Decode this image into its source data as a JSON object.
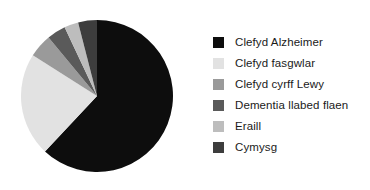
{
  "chart_data": {
    "type": "pie",
    "title": "",
    "labels": [
      "Clefyd Alzheimer",
      "Clefyd fasgwlar",
      "Clefyd cyrff Lewy",
      "Dementia llabed flaen",
      "Eraill",
      "Cymysg"
    ],
    "values": [
      62,
      22,
      5,
      4,
      3,
      4
    ],
    "colors": [
      "#0d0d0d",
      "#e2e2e2",
      "#9a9a9a",
      "#5a5a5a",
      "#bdbdbd",
      "#3d3d3d"
    ],
    "start_angle_deg": 0,
    "direction": "clockwise",
    "legend_position": "right",
    "grid": false,
    "xlabel": "",
    "ylabel": ""
  },
  "legend": {
    "items": [
      {
        "label": "Clefyd Alzheimer",
        "color": "#0d0d0d"
      },
      {
        "label": "Clefyd fasgwlar",
        "color": "#e2e2e2"
      },
      {
        "label": "Clefyd cyrff Lewy",
        "color": "#9a9a9a"
      },
      {
        "label": "Dementia llabed flaen",
        "color": "#5a5a5a"
      },
      {
        "label": "Eraill",
        "color": "#bdbdbd"
      },
      {
        "label": "Cymysg",
        "color": "#3d3d3d"
      }
    ]
  }
}
